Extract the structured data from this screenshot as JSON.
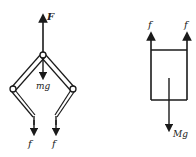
{
  "left_figure": {
    "labels": {
      "force_up": "F",
      "weight": "mg",
      "friction_left": "f",
      "friction_right": "f"
    }
  },
  "right_figure": {
    "labels": {
      "friction_left": "f",
      "friction_right": "f",
      "weight": "Mg"
    }
  },
  "colors": {
    "stroke": "#1a1a1a",
    "background": "#ffffff"
  }
}
